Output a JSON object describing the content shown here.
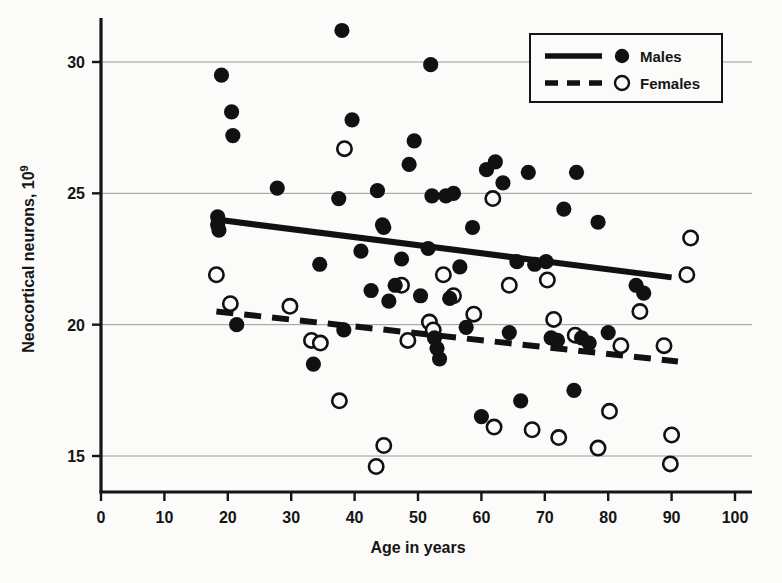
{
  "chart_data": {
    "type": "scatter",
    "title": "",
    "xlabel": "Age in years",
    "ylabel": "Neocortical neurons, 10",
    "ylabel_superscript": "9",
    "xlim": [
      0,
      100
    ],
    "ylim": [
      14.2,
      31.6
    ],
    "xticks": [
      0,
      10,
      20,
      30,
      40,
      50,
      60,
      70,
      80,
      90,
      100
    ],
    "xticklabels": [
      "0",
      "10",
      "20",
      "30",
      "40",
      "50",
      "60",
      "70",
      "80",
      "90",
      "100"
    ],
    "yticks": [
      15,
      20,
      25,
      30
    ],
    "yticklabels": [
      "15",
      "20",
      "25",
      "30"
    ],
    "grid": "horizontal",
    "legend_position": "top-right",
    "legend": [
      {
        "name": "Males",
        "marker": "filled-circle",
        "line": "solid",
        "color": "#111111"
      },
      {
        "name": "Females",
        "marker": "open-circle",
        "line": "dashed",
        "color": "#111111"
      }
    ],
    "series": [
      {
        "name": "Males",
        "marker": "filled-circle",
        "points": [
          [
            18.4,
            24.1
          ],
          [
            18.4,
            23.8
          ],
          [
            18.6,
            23.6
          ],
          [
            19.0,
            29.5
          ],
          [
            20.6,
            28.1
          ],
          [
            20.8,
            27.2
          ],
          [
            21.4,
            20.0
          ],
          [
            27.8,
            25.2
          ],
          [
            33.5,
            18.5
          ],
          [
            34.5,
            22.3
          ],
          [
            37.5,
            24.8
          ],
          [
            38.0,
            31.2
          ],
          [
            38.3,
            19.8
          ],
          [
            39.6,
            27.8
          ],
          [
            41.0,
            22.8
          ],
          [
            42.6,
            21.3
          ],
          [
            43.6,
            25.1
          ],
          [
            44.4,
            23.8
          ],
          [
            44.6,
            23.7
          ],
          [
            45.4,
            20.9
          ],
          [
            46.4,
            21.5
          ],
          [
            47.4,
            22.5
          ],
          [
            48.6,
            26.1
          ],
          [
            49.4,
            27.0
          ],
          [
            50.4,
            21.1
          ],
          [
            51.6,
            22.9
          ],
          [
            52.0,
            29.9
          ],
          [
            52.2,
            24.9
          ],
          [
            52.6,
            19.5
          ],
          [
            53.0,
            19.1
          ],
          [
            53.4,
            18.7
          ],
          [
            54.4,
            24.9
          ],
          [
            55.0,
            21.0
          ],
          [
            55.6,
            25.0
          ],
          [
            56.6,
            22.2
          ],
          [
            57.6,
            19.9
          ],
          [
            58.6,
            23.7
          ],
          [
            60.0,
            16.5
          ],
          [
            60.8,
            25.9
          ],
          [
            62.2,
            26.2
          ],
          [
            63.4,
            25.4
          ],
          [
            64.4,
            19.7
          ],
          [
            65.6,
            22.4
          ],
          [
            66.2,
            17.1
          ],
          [
            67.4,
            25.8
          ],
          [
            68.4,
            22.3
          ],
          [
            70.2,
            22.4
          ],
          [
            71.0,
            19.5
          ],
          [
            72.0,
            19.4
          ],
          [
            73.0,
            24.4
          ],
          [
            74.6,
            17.5
          ],
          [
            75.0,
            25.8
          ],
          [
            75.8,
            19.5
          ],
          [
            77.0,
            19.3
          ],
          [
            78.4,
            23.9
          ],
          [
            80.0,
            19.7
          ],
          [
            84.4,
            21.5
          ],
          [
            85.6,
            21.2
          ]
        ]
      },
      {
        "name": "Females",
        "marker": "open-circle",
        "points": [
          [
            18.2,
            21.9
          ],
          [
            20.4,
            20.8
          ],
          [
            29.8,
            20.7
          ],
          [
            33.2,
            19.4
          ],
          [
            34.6,
            19.3
          ],
          [
            37.6,
            17.1
          ],
          [
            38.4,
            26.7
          ],
          [
            43.4,
            14.6
          ],
          [
            44.6,
            15.4
          ],
          [
            47.4,
            21.5
          ],
          [
            48.4,
            19.4
          ],
          [
            51.8,
            20.1
          ],
          [
            52.4,
            19.8
          ],
          [
            54.0,
            21.9
          ],
          [
            55.6,
            21.1
          ],
          [
            58.8,
            20.4
          ],
          [
            61.8,
            24.8
          ],
          [
            62.0,
            16.1
          ],
          [
            64.4,
            21.5
          ],
          [
            68.0,
            16.0
          ],
          [
            70.4,
            21.7
          ],
          [
            71.4,
            20.2
          ],
          [
            72.2,
            15.7
          ],
          [
            74.8,
            19.6
          ],
          [
            78.4,
            15.3
          ],
          [
            80.2,
            16.7
          ],
          [
            82.0,
            19.2
          ],
          [
            85.0,
            20.5
          ],
          [
            88.8,
            19.2
          ],
          [
            89.8,
            14.7
          ],
          [
            90.0,
            15.8
          ],
          [
            92.4,
            21.9
          ],
          [
            93.0,
            23.3
          ]
        ]
      }
    ],
    "trendlines": [
      {
        "name": "Males",
        "style": "solid",
        "x0": 18.2,
        "y0": 24.0,
        "x1": 90.0,
        "y1": 21.8
      },
      {
        "name": "Females",
        "style": "dashed",
        "x0": 18.2,
        "y0": 20.5,
        "x1": 91.0,
        "y1": 18.6
      }
    ]
  }
}
